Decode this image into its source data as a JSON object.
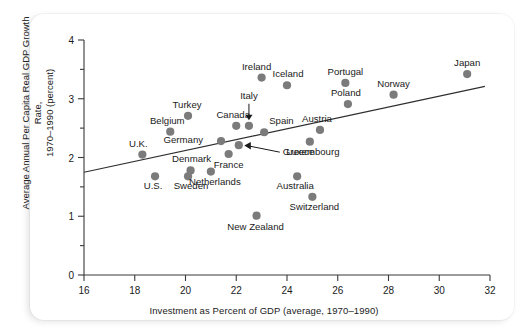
{
  "chart_data": {
    "type": "scatter",
    "title": "",
    "xlabel": "Investment as Percent of GDP (average, 1970–1990)",
    "ylabel_line1": "Average Annual Per Capita Real GDP Growth Rate,",
    "ylabel_line2": "1970–1990 (percent)",
    "xlim": [
      16,
      32
    ],
    "ylim": [
      0,
      4
    ],
    "xticks": [
      16,
      18,
      20,
      22,
      24,
      26,
      28,
      30,
      32
    ],
    "xtick_labels": [
      "16",
      "18",
      "20",
      "22",
      "24",
      "26",
      "28",
      "30",
      "32"
    ],
    "yticks": [
      0,
      1,
      2,
      3,
      4
    ],
    "ytick_labels": [
      "0",
      "1",
      "2",
      "3",
      "4"
    ],
    "y_minor_ticks": [
      0.5,
      1.5,
      2.5,
      3.5
    ],
    "grid": false,
    "legend": "none",
    "marker_color": "#7b7b7b",
    "axis_color": "#3a3a3a",
    "trend_line": {
      "label": "regression line",
      "x0": 16.0,
      "y0": 1.75,
      "x1": 31.8,
      "y1": 3.21
    },
    "points": [
      {
        "label": "U.K.",
        "x": 18.3,
        "y": 2.05,
        "label_dx": -4,
        "label_dy": -8,
        "anchor": "middle"
      },
      {
        "label": "U.S.",
        "x": 18.8,
        "y": 1.68,
        "label_dx": -2,
        "label_dy": 13,
        "anchor": "middle"
      },
      {
        "label": "Turkey",
        "x": 20.1,
        "y": 2.71,
        "label_dx": -1,
        "label_dy": -8,
        "anchor": "middle"
      },
      {
        "label": "Belgium",
        "x": 19.4,
        "y": 2.44,
        "label_dx": -3,
        "label_dy": -8,
        "anchor": "middle"
      },
      {
        "label": "Germany",
        "x": 21.4,
        "y": 2.28,
        "label_dx": -18,
        "label_dy": 2,
        "anchor": "end"
      },
      {
        "label": "Denmark",
        "x": 20.2,
        "y": 1.78,
        "label_dx": 1,
        "label_dy": -8,
        "anchor": "middle"
      },
      {
        "label": "Sweden",
        "x": 20.1,
        "y": 1.68,
        "label_dx": 3,
        "label_dy": 13,
        "anchor": "middle"
      },
      {
        "label": "Netherlands",
        "x": 21.0,
        "y": 1.76,
        "label_dx": 4,
        "label_dy": 13,
        "anchor": "middle"
      },
      {
        "label": "Canada",
        "x": 22.0,
        "y": 2.54,
        "label_dx": -3,
        "label_dy": -8,
        "anchor": "middle"
      },
      {
        "label": "Italy",
        "x": 22.5,
        "y": 2.54,
        "label_dx": 0,
        "label_dy": -27,
        "anchor": "middle"
      },
      {
        "label": "Spain",
        "x": 23.1,
        "y": 2.43,
        "label_dx": 5,
        "label_dy": -8,
        "anchor": "start"
      },
      {
        "label": "France",
        "x": 21.7,
        "y": 2.06,
        "label_dx": 0,
        "label_dy": 14,
        "anchor": "middle"
      },
      {
        "label": "Greece",
        "x": 22.1,
        "y": 2.21,
        "label_dx": 44,
        "label_dy": 10,
        "anchor": "start"
      },
      {
        "label": "Ireland",
        "x": 23.0,
        "y": 3.36,
        "label_dx": -5,
        "label_dy": -8,
        "anchor": "middle"
      },
      {
        "label": "Iceland",
        "x": 24.0,
        "y": 3.23,
        "label_dx": 1,
        "label_dy": -8,
        "anchor": "middle"
      },
      {
        "label": "Austria",
        "x": 25.3,
        "y": 2.47,
        "label_dx": -3,
        "label_dy": -8,
        "anchor": "middle"
      },
      {
        "label": "Luxembourg",
        "x": 24.9,
        "y": 2.27,
        "label_dx": 3,
        "label_dy": 13,
        "anchor": "middle"
      },
      {
        "label": "Portugal",
        "x": 26.3,
        "y": 3.27,
        "label_dx": 0,
        "label_dy": -8,
        "anchor": "middle"
      },
      {
        "label": "Poland",
        "x": 26.4,
        "y": 2.91,
        "label_dx": -2,
        "label_dy": -8,
        "anchor": "middle"
      },
      {
        "label": "Norway",
        "x": 28.2,
        "y": 3.07,
        "label_dx": 0,
        "label_dy": -8,
        "anchor": "middle"
      },
      {
        "label": "Japan",
        "x": 31.1,
        "y": 3.42,
        "label_dx": 0,
        "label_dy": -8,
        "anchor": "middle"
      },
      {
        "label": "Australia",
        "x": 24.4,
        "y": 1.68,
        "label_dx": -2,
        "label_dy": 13,
        "anchor": "middle"
      },
      {
        "label": "Switzerland",
        "x": 25.0,
        "y": 1.33,
        "label_dx": 2,
        "label_dy": 13,
        "anchor": "middle"
      },
      {
        "label": "New Zealand",
        "x": 22.8,
        "y": 1.01,
        "label_dx": -1,
        "label_dy": 14,
        "anchor": "middle"
      }
    ],
    "annotations": [
      {
        "name": "italy-leader",
        "from_label": "Italy",
        "kind": "arrow-down"
      },
      {
        "name": "greece-leader",
        "from_label": "Greece",
        "kind": "arrow-left"
      }
    ]
  }
}
